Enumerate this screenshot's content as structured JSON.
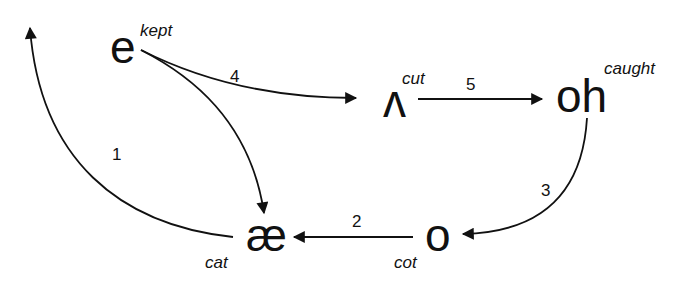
{
  "diagram": {
    "type": "vowel-shift",
    "nodes": [
      {
        "id": "e",
        "symbol": "e",
        "word": "kept"
      },
      {
        "id": "ae",
        "symbol": "æ",
        "word": "cat"
      },
      {
        "id": "caret",
        "symbol": "ʌ",
        "word": "cut"
      },
      {
        "id": "oh",
        "symbol": "oh",
        "word": "caught"
      },
      {
        "id": "o",
        "symbol": "o",
        "word": "cot"
      }
    ],
    "edges": [
      {
        "step": "1",
        "from": "ae",
        "to": "up-left (off-figure)"
      },
      {
        "step": "2",
        "from": "o",
        "to": "ae"
      },
      {
        "step": "3",
        "from": "oh",
        "to": "o"
      },
      {
        "step": "4",
        "from": "e",
        "to": "caret"
      },
      {
        "step": "5",
        "from": "caret",
        "to": "oh"
      },
      {
        "step": "",
        "from": "e",
        "to": "ae"
      }
    ],
    "stroke_color": "#111111",
    "background": "#ffffff"
  }
}
